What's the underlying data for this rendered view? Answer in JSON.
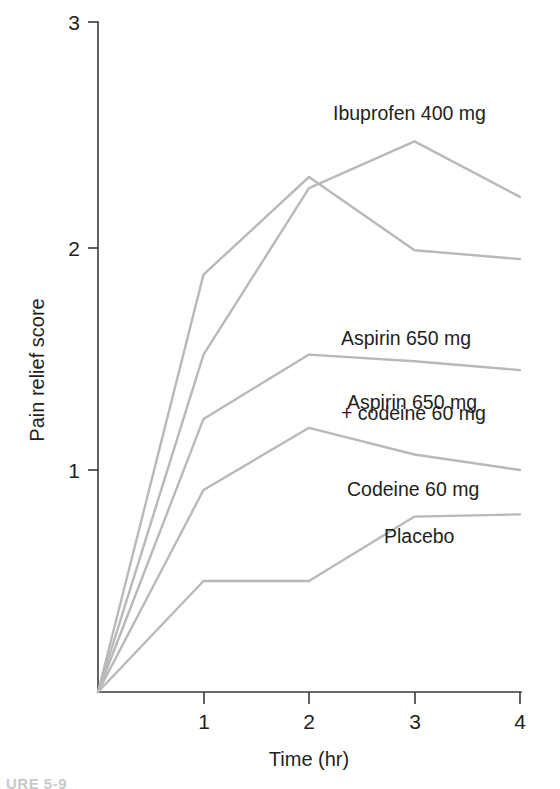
{
  "figure": {
    "caption": "URE 5-9",
    "line_color": "#b9b9b9",
    "axis_color": "#3a3a3a"
  },
  "chart_data": {
    "type": "line",
    "title": "",
    "xlabel": "Time (hr)",
    "ylabel": "Pain relief score",
    "x": [
      0,
      1,
      2,
      3,
      4
    ],
    "xticks": [
      "1",
      "2",
      "3",
      "4"
    ],
    "yticks": [
      "1",
      "2",
      "3"
    ],
    "xlim": [
      0,
      4
    ],
    "ylim": [
      0,
      3
    ],
    "grid": false,
    "legend": "inline-labels",
    "series": [
      {
        "name": "Ibuprofen 400 mg",
        "values": [
          0,
          1.52,
          2.27,
          2.48,
          2.23
        ],
        "label": "Ibuprofen 400 mg",
        "label_x": 333,
        "label_y": 101
      },
      {
        "name": "Aspirin 650 mg + codeine 60 mg",
        "values": [
          0,
          1.88,
          2.32,
          1.99,
          1.95
        ],
        "label": "Aspirin 650 mg",
        "label2": "+ codeine 60 mg",
        "label_x": 341,
        "label_y": 276
      },
      {
        "name": "Aspirin 650 mg",
        "values": [
          0,
          1.23,
          1.52,
          1.49,
          1.45
        ],
        "label": "Aspirin 650 mg",
        "label_x": 347,
        "label_y": 390
      },
      {
        "name": "Codeine 60 mg",
        "values": [
          0,
          0.91,
          1.19,
          1.07,
          1.0
        ],
        "label": "Codeine 60 mg",
        "label_x": 347,
        "label_y": 477
      },
      {
        "name": "Placebo",
        "values": [
          0,
          0.5,
          0.5,
          0.79,
          0.8
        ],
        "label": "Placebo",
        "label_x": 384,
        "label_y": 524
      }
    ]
  }
}
